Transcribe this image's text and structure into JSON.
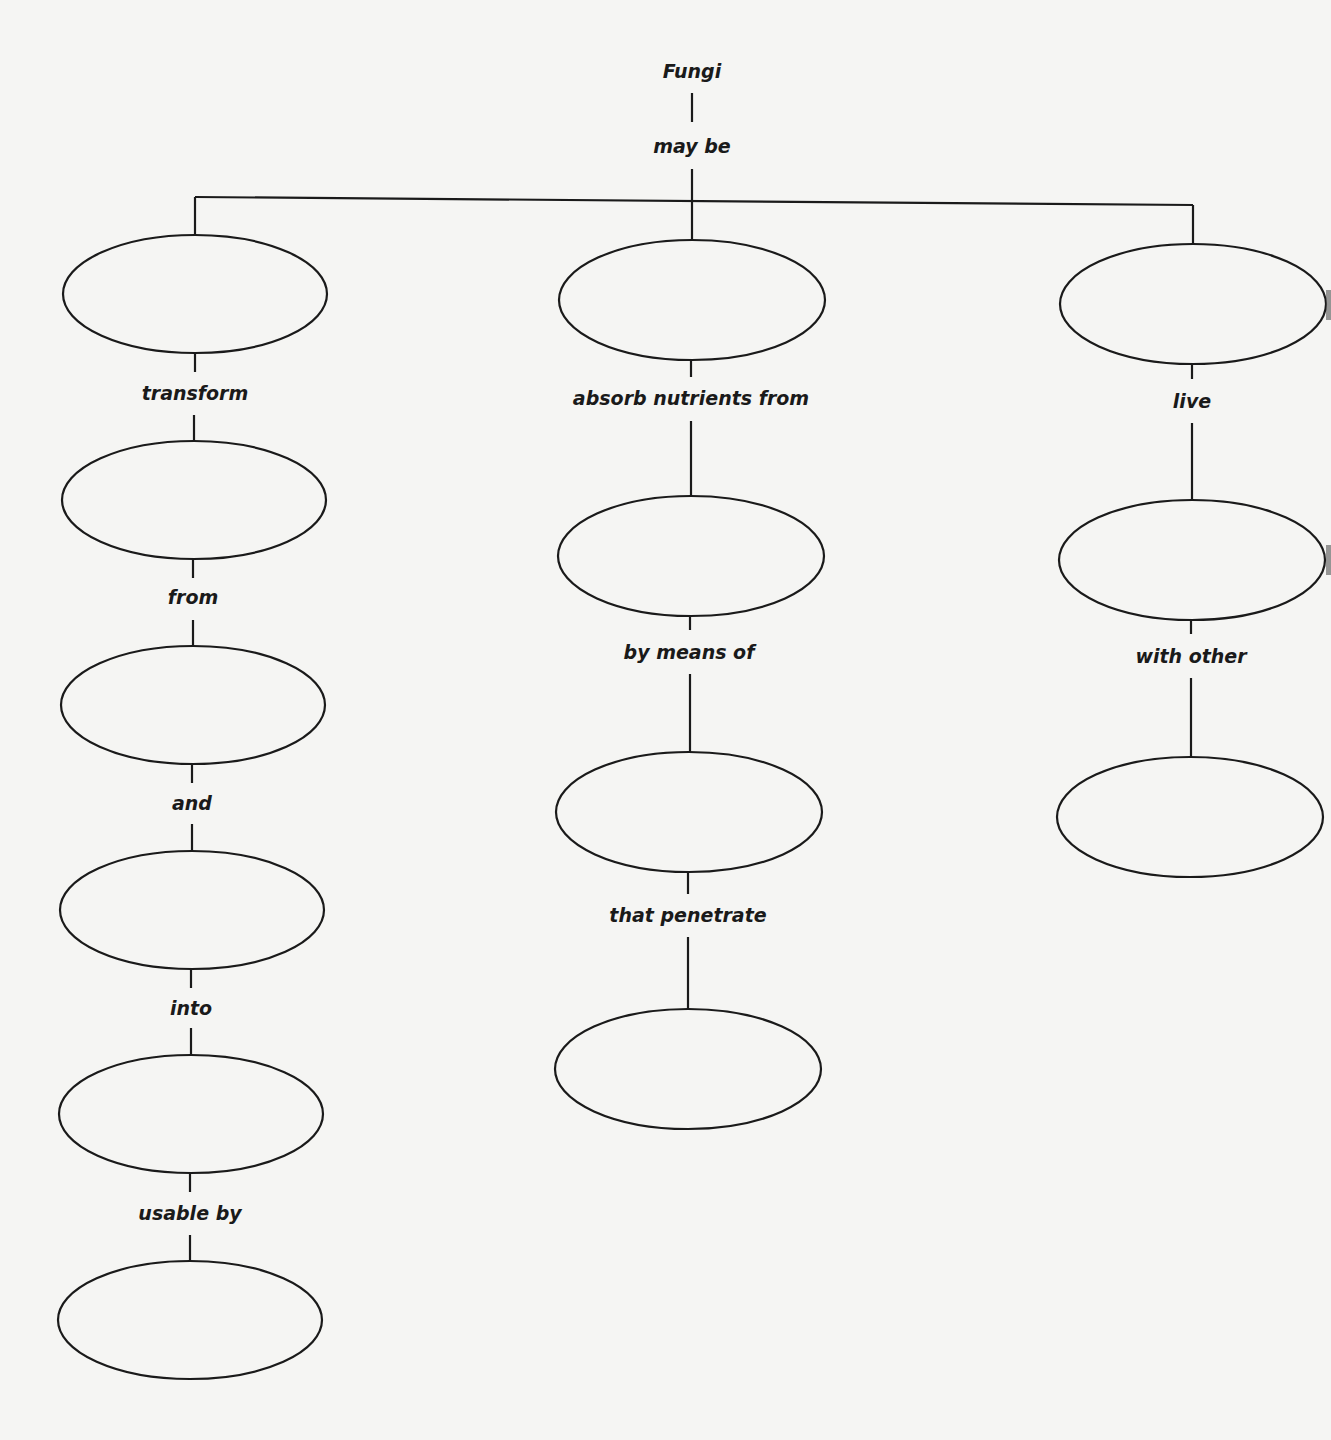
{
  "diagram": {
    "title": "Fungi",
    "root_link": "may be",
    "branches": [
      {
        "name": "left",
        "links": [
          "transform",
          "from",
          "and",
          "into",
          "usable by"
        ],
        "node_count": 6
      },
      {
        "name": "center",
        "links": [
          "absorb nutrients from",
          "by means of",
          "that penetrate"
        ],
        "node_count": 4
      },
      {
        "name": "right",
        "links": [
          "live",
          "with other"
        ],
        "node_count": 3
      }
    ],
    "nodes_blank": true,
    "colors": {
      "line": "#1a1a1a",
      "background": "#f5f5f3"
    }
  }
}
